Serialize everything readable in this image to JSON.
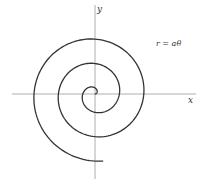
{
  "figure": {
    "type": "archimedean-spiral",
    "equation_label": "r = aθ",
    "x_axis_label": "x",
    "y_axis_label": "y",
    "colors": {
      "curve": "#333333",
      "axis": "#888888",
      "background": "#ffffff"
    }
  }
}
